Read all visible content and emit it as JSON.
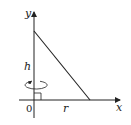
{
  "diagram": {
    "type": "cone-cross-section",
    "labels": {
      "y_axis": "y",
      "x_axis": "x",
      "origin": "0",
      "height": "h",
      "radius": "r"
    },
    "colors": {
      "stroke": "#222222",
      "background": "#ffffff"
    },
    "geometry": {
      "origin_px": [
        34,
        100
      ],
      "height_top_px": [
        34,
        31
      ],
      "radius_end_px": [
        90,
        100
      ]
    }
  }
}
